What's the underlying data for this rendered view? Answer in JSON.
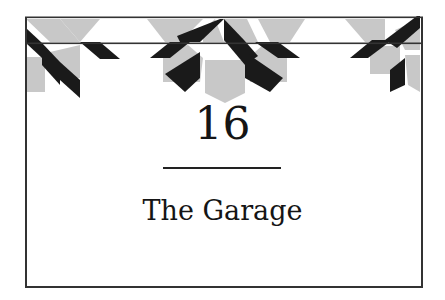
{
  "chapter": {
    "number": "16",
    "title": "The Garage"
  },
  "decoration": {
    "motif": "quilt-star-border",
    "colors": {
      "gray": "#c8c8c8",
      "black": "#1a1a1a",
      "line": "#333333"
    }
  }
}
